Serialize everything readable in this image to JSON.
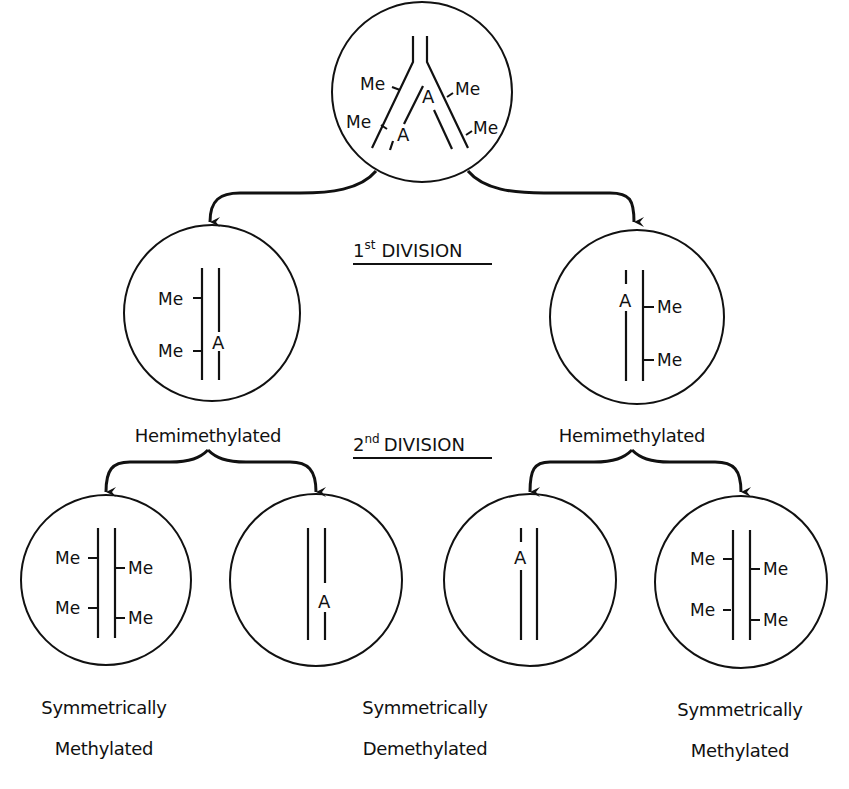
{
  "diagram": {
    "title_labels": {
      "first_division": {
        "num": "1",
        "sup": "st",
        "word": "DIVISION"
      },
      "second_division": {
        "num": "2",
        "sup": "nd",
        "word": "DIVISION"
      }
    },
    "strand_marks": {
      "methyl": "Me",
      "adenine": "A"
    },
    "nodes": [
      {
        "id": "parent",
        "state": "Replication fork, fully methylated parental DNA",
        "marks": [
          "Me",
          "Me",
          "A",
          "Me",
          "Me",
          "A"
        ]
      },
      {
        "id": "gen1-left",
        "label": "Hemimethylated",
        "marks": [
          "Me",
          "Me",
          "A"
        ]
      },
      {
        "id": "gen1-right",
        "label": "Hemimethylated",
        "marks": [
          "A",
          "Me",
          "Me"
        ]
      },
      {
        "id": "gen2-1",
        "label_line1": "Symmetrically",
        "label_line2": "Methylated",
        "marks": [
          "Me",
          "Me",
          "Me",
          "Me"
        ]
      },
      {
        "id": "gen2-2",
        "marks": [
          "A"
        ]
      },
      {
        "id": "gen2-3",
        "marks": [
          "A"
        ]
      },
      {
        "id": "gen2-4",
        "label_line1": "Symmetrically",
        "label_line2": "Methylated",
        "marks": [
          "Me",
          "Me",
          "Me",
          "Me"
        ]
      }
    ],
    "center_bottom_label": {
      "line1": "Symmetrically",
      "line2": "Demethylated"
    },
    "colors": {
      "ink": "#111111",
      "background": "#ffffff"
    }
  }
}
